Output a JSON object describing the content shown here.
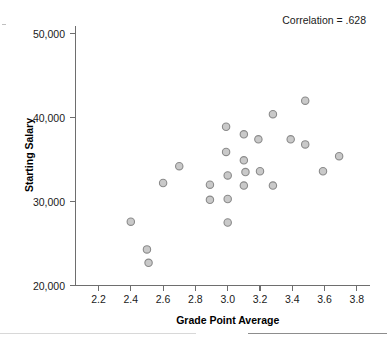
{
  "chart_data": {
    "type": "scatter",
    "title": "",
    "subtitle": "",
    "xlabel": "Grade Point Average",
    "ylabel": "Starting Salary",
    "xlim": [
      2.1,
      3.87
    ],
    "ylim": [
      20000,
      52000
    ],
    "xticks": [
      "2.2",
      "2.4",
      "2.6",
      "2.8",
      "3.0",
      "3.2",
      "3.4",
      "3.6",
      "3.8"
    ],
    "xtick_values": [
      2.2,
      2.4,
      2.6,
      2.8,
      3.0,
      3.2,
      3.4,
      3.6,
      3.8
    ],
    "yticks": [
      "20,000",
      "30,000",
      "40,000",
      "50,000"
    ],
    "ytick_values": [
      20000,
      30000,
      40000,
      50000
    ],
    "grid": false,
    "legend": null,
    "legend_position": "none",
    "annotations": [
      {
        "name": "correlation-annotation",
        "text": "Correlation = .628",
        "x": 3.78,
        "y": 51200
      }
    ],
    "marker": {
      "shape": "circle",
      "fill": "#c9c9c9",
      "edge": "#8a8a8a",
      "size": 7.4
    },
    "series": [
      {
        "name": "Students",
        "points": [
          [
            2.4,
            27600
          ],
          [
            2.5,
            24300
          ],
          [
            2.51,
            22700
          ],
          [
            2.6,
            32200
          ],
          [
            2.7,
            34200
          ],
          [
            2.89,
            32000
          ],
          [
            2.89,
            30200
          ],
          [
            2.99,
            38900
          ],
          [
            2.99,
            35900
          ],
          [
            3.0,
            33100
          ],
          [
            3.0,
            30300
          ],
          [
            3.0,
            27500
          ],
          [
            3.1,
            38000
          ],
          [
            3.1,
            34900
          ],
          [
            3.11,
            33500
          ],
          [
            3.1,
            31900
          ],
          [
            3.19,
            37400
          ],
          [
            3.2,
            33600
          ],
          [
            3.28,
            40400
          ],
          [
            3.28,
            31900
          ],
          [
            3.39,
            37400
          ],
          [
            3.48,
            42000
          ],
          [
            3.48,
            36800
          ],
          [
            3.59,
            33600
          ],
          [
            3.69,
            35400
          ]
        ]
      }
    ]
  },
  "figure": {
    "background_color": "#ffffff",
    "axis_color": "#6e6e6e",
    "text_color": "#1a1a1a"
  }
}
